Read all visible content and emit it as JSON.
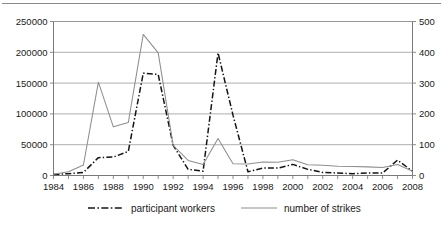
{
  "figure": {
    "top_rule_visible": true,
    "background_color": "#ffffff"
  },
  "legend": {
    "position": "bottom",
    "entries": [
      {
        "label": "participant workers",
        "style": "dash-dot",
        "color": "#141414"
      },
      {
        "label": "number of strikes",
        "style": "solid",
        "color": "#8e8e8e"
      }
    ]
  },
  "axes": {
    "left": {
      "ticks": [
        "0",
        "50000",
        "100000",
        "150000",
        "200000",
        "250000"
      ],
      "min": 0,
      "max": 250000
    },
    "right": {
      "ticks": [
        "0",
        "100",
        "200",
        "300",
        "400",
        "500"
      ],
      "min": 0,
      "max": 500
    },
    "bottom": {
      "ticks": [
        "1984",
        "1986",
        "1988",
        "1990",
        "1992",
        "1994",
        "1996",
        "1998",
        "2000",
        "2002",
        "2004",
        "2006",
        "2008"
      ]
    }
  },
  "chart_data": {
    "type": "line",
    "title": "",
    "subtitle": "",
    "xlabel": "",
    "ylabel": "",
    "grid": true,
    "legend_position": "bottom",
    "x": [
      1984,
      1985,
      1986,
      1987,
      1988,
      1989,
      1990,
      1991,
      1992,
      1993,
      1994,
      1995,
      1996,
      1997,
      1998,
      1999,
      2000,
      2001,
      2002,
      2003,
      2004,
      2005,
      2006,
      2007,
      2008
    ],
    "axis_ranges": {
      "x": [
        1984,
        2008
      ],
      "y_left": [
        0,
        250000
      ],
      "y_right": [
        0,
        500
      ]
    },
    "series": [
      {
        "name": "participant workers",
        "axis": "left",
        "ylabel": "participant workers",
        "ylim": [
          0,
          250000
        ],
        "style": "dash-dot",
        "color": "#141414",
        "values": [
          1500,
          3000,
          5000,
          29000,
          30000,
          39000,
          166000,
          164000,
          49000,
          10000,
          7000,
          199000,
          98000,
          6000,
          12000,
          12000,
          18000,
          10000,
          5000,
          4000,
          3000,
          4000,
          4000,
          25000,
          7000
        ]
      },
      {
        "name": "number of strikes",
        "axis": "right",
        "ylabel": "number of strikes",
        "ylim": [
          0,
          500
        ],
        "style": "solid",
        "color": "#8e8e8e",
        "values": [
          4,
          12,
          34,
          303,
          158,
          172,
          458,
          398,
          98,
          49,
          36,
          120,
          38,
          37,
          44,
          43,
          51,
          35,
          33,
          30,
          29,
          28,
          26,
          36,
          14
        ]
      }
    ]
  }
}
